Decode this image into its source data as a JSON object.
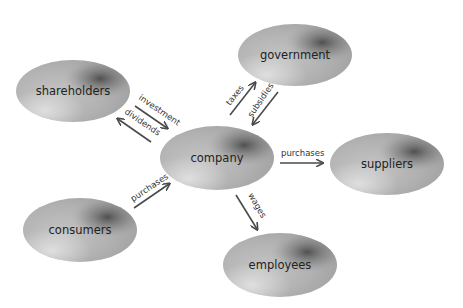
{
  "diagram": {
    "title": "",
    "colors": {
      "ellipse_base": "#b5b5b5",
      "ellipse_light": "#d8d8d8",
      "ellipse_dark": "#555555",
      "arrow": "#4a4a4a",
      "text": "#222222"
    },
    "nodes": [
      {
        "id": "shareholders",
        "label": "shareholders",
        "cx": 73,
        "cy": 91,
        "rx": 57,
        "ry": 31
      },
      {
        "id": "government",
        "label": "government",
        "cx": 295,
        "cy": 55,
        "rx": 57,
        "ry": 31
      },
      {
        "id": "company",
        "label": "company",
        "cx": 217,
        "cy": 158,
        "rx": 57,
        "ry": 32
      },
      {
        "id": "suppliers",
        "label": "suppliers",
        "cx": 387,
        "cy": 164,
        "rx": 57,
        "ry": 31
      },
      {
        "id": "consumers",
        "label": "consumers",
        "cx": 80,
        "cy": 230,
        "rx": 57,
        "ry": 32
      },
      {
        "id": "employees",
        "label": "employees",
        "cx": 280,
        "cy": 265,
        "rx": 57,
        "ry": 32
      }
    ],
    "edges": [
      {
        "id": "investment",
        "label": "investment",
        "from": "shareholders",
        "to": "company"
      },
      {
        "id": "dividends",
        "label": "dividends",
        "from": "company",
        "to": "shareholders"
      },
      {
        "id": "taxes",
        "label": "taxes",
        "from": "company",
        "to": "government"
      },
      {
        "id": "subsidies",
        "label": "subsidies",
        "from": "government",
        "to": "company"
      },
      {
        "id": "purchases-suppliers",
        "label": "purchases",
        "from": "company",
        "to": "suppliers"
      },
      {
        "id": "purchases-consumers",
        "label": "purchases",
        "from": "consumers",
        "to": "company"
      },
      {
        "id": "wages",
        "label": "wages",
        "from": "company",
        "to": "employees"
      }
    ]
  }
}
